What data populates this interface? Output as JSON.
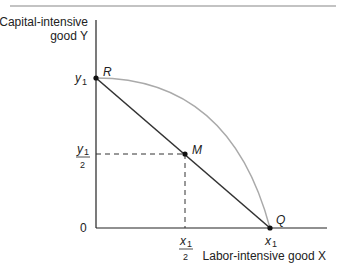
{
  "diagram": {
    "y_axis_label_line1": "Capital-intensive",
    "y_axis_label_line2": "good Y",
    "x_axis_label": "Labor-intensive good X",
    "origin_label": "0",
    "y_tick_top": "y",
    "y_tick_top_sub": "1",
    "y_tick_half_num": "y",
    "y_tick_half_sub": "1",
    "y_tick_half_den": "2",
    "x_tick_full": "x",
    "x_tick_full_sub": "1",
    "x_tick_half_num": "x",
    "x_tick_half_sub": "1",
    "x_tick_half_den": "2",
    "points": {
      "R": "R",
      "M": "M",
      "Q": "Q"
    },
    "colors": {
      "axis": "#222222",
      "line": "#333333",
      "curve": "#aaaaaa",
      "top_rule": "#888888"
    }
  }
}
